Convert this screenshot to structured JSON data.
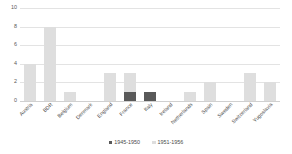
{
  "chart_data": {
    "type": "bar",
    "stacked": true,
    "title": "",
    "subtitle": "",
    "xlabel": "",
    "ylabel": "",
    "ylim": [
      0,
      10
    ],
    "yticks": [
      0,
      2,
      4,
      6,
      8,
      10
    ],
    "grid": true,
    "legend_position": "bottom-center",
    "categories": [
      "Austria",
      "BDR",
      "Belgium",
      "Denmark",
      "England",
      "France",
      "Italy",
      "Ireland",
      "Netherlands",
      "Spain",
      "Sweden",
      "Switzerland",
      "Yugoslavia"
    ],
    "series": [
      {
        "name": "1945-1950",
        "color": "#595959",
        "values": [
          0,
          0,
          0,
          0,
          0,
          1,
          1,
          0,
          0,
          0,
          0,
          0,
          0
        ]
      },
      {
        "name": "1951-1956",
        "color": "#dedede",
        "values": [
          4,
          8,
          1,
          0,
          3,
          2,
          0,
          0,
          1,
          2,
          0,
          3,
          2
        ]
      }
    ],
    "totals": [
      4,
      8,
      1,
      0,
      3,
      3,
      1,
      0,
      1,
      2,
      0,
      3,
      2
    ]
  },
  "legend": {
    "items": [
      {
        "label": "1945-1950",
        "swatch": "legend-swatch-dark"
      },
      {
        "label": "1951-1956",
        "swatch": "legend-swatch-light"
      }
    ]
  },
  "axis": {
    "y_tick_labels": [
      "10",
      "8",
      "6",
      "4",
      "2",
      "0"
    ]
  }
}
